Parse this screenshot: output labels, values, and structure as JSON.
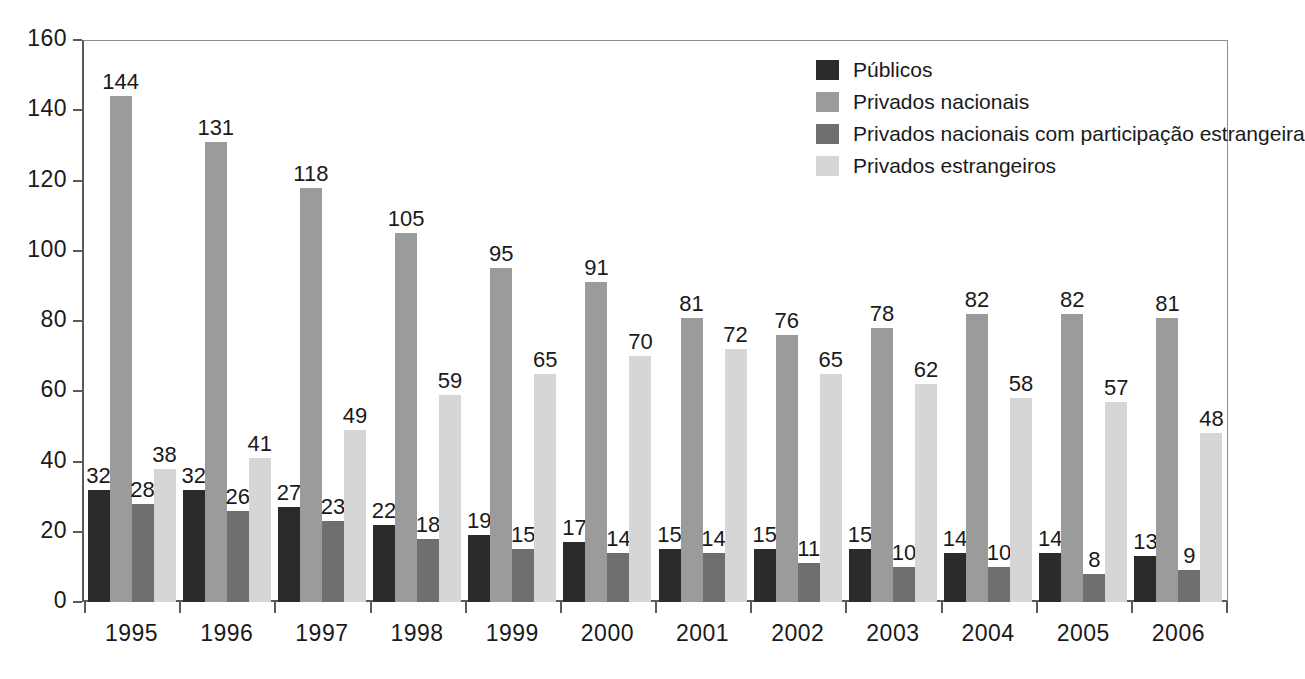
{
  "chart_data": {
    "type": "bar",
    "title": "",
    "subtitle": "",
    "xlabel": "",
    "ylabel": "",
    "ylim": [
      0,
      160
    ],
    "yticks": [
      0,
      20,
      40,
      60,
      80,
      100,
      120,
      140,
      160
    ],
    "grid": false,
    "legend_position": "top-right",
    "categories": [
      "1995",
      "1996",
      "1997",
      "1998",
      "1999",
      "2000",
      "2001",
      "2002",
      "2003",
      "2004",
      "2005",
      "2006"
    ],
    "series": [
      {
        "name": "Públicos",
        "color": "#2b2b2b",
        "values": [
          32,
          32,
          27,
          22,
          19,
          17,
          15,
          15,
          15,
          14,
          14,
          13
        ]
      },
      {
        "name": "Privados nacionais",
        "color": "#9b9b9b",
        "values": [
          144,
          131,
          118,
          105,
          95,
          91,
          81,
          76,
          78,
          82,
          82,
          81
        ]
      },
      {
        "name": "Privados nacionais com participação estrangeira",
        "color": "#6f6f6f",
        "values": [
          28,
          26,
          23,
          18,
          15,
          14,
          14,
          11,
          10,
          10,
          8,
          9
        ]
      },
      {
        "name": "Privados estrangeiros",
        "color": "#d6d6d6",
        "values": [
          38,
          41,
          49,
          59,
          65,
          70,
          72,
          65,
          62,
          58,
          57,
          48
        ]
      }
    ]
  },
  "legend": {
    "items": [
      {
        "label": "Públicos",
        "color": "#2b2b2b"
      },
      {
        "label": "Privados nacionais",
        "color": "#9b9b9b"
      },
      {
        "label": "Privados nacionais com participação estrangeira",
        "color": "#6f6f6f"
      },
      {
        "label": "Privados estrangeiros",
        "color": "#d6d6d6"
      }
    ]
  },
  "axes": {
    "y_tick_labels": [
      "0",
      "20",
      "40",
      "60",
      "80",
      "100",
      "120",
      "140",
      "160"
    ],
    "x_tick_labels": [
      "1995",
      "1996",
      "1997",
      "1998",
      "1999",
      "2000",
      "2001",
      "2002",
      "2003",
      "2004",
      "2005",
      "2006"
    ]
  }
}
